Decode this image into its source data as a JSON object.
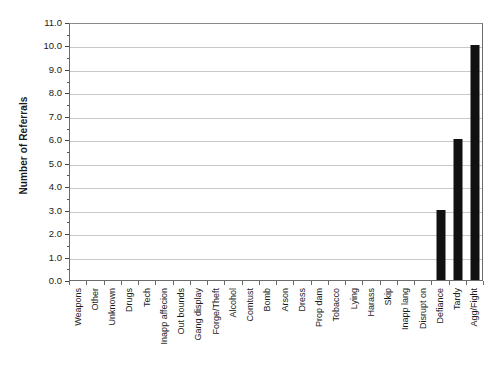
{
  "chart_data": {
    "type": "bar",
    "title": "",
    "xlabel": "",
    "ylabel": "Number of Referrals",
    "ylim": [
      0,
      11
    ],
    "ytick_step": 1.0,
    "yticks": [
      "0.0",
      "1.0",
      "2.0",
      "3.0",
      "4.0",
      "5.0",
      "6.0",
      "7.0",
      "8.0",
      "9.0",
      "10.0",
      "11.0"
    ],
    "ytick_values": [
      0,
      1,
      2,
      3,
      4,
      5,
      6,
      7,
      8,
      9,
      10,
      11
    ],
    "minor_tick_step": 0.5,
    "grid": "horizontal",
    "legend": "none",
    "bar_color": "#111111",
    "gridline_color": "#c8c8c8",
    "axis_color": "#6b6b6b",
    "categories": [
      "Weapons",
      "Other",
      "Unknown",
      "Drugs",
      "Tech",
      "Inapp affecion",
      "Out bounds",
      "Gang display",
      "Forge/Theft",
      "Alcohol",
      "Comtust",
      "Bomb",
      "Arson",
      "Dress",
      "Prop dam",
      "Tobacco",
      "Lying",
      "Harass",
      "Skip",
      "Inapp lang",
      "Disrupt on",
      "Defiance",
      "Tardy",
      "Agg/Fight"
    ],
    "values": [
      0,
      0,
      0,
      0,
      0,
      0,
      0,
      0,
      0,
      0,
      0,
      0,
      0,
      0,
      0,
      0,
      0,
      0,
      0,
      0,
      0,
      3,
      6,
      10
    ]
  }
}
